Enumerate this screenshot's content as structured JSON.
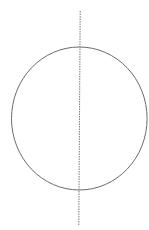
{
  "diagram": {
    "width": 149,
    "height": 230,
    "background": "#ffffff",
    "circle": {
      "cx": 79.3,
      "cy": 118.5,
      "rx": 67.8,
      "ry": 71.5,
      "stroke": "#6b6b6b",
      "stroke_width": 1
    },
    "axis_line": {
      "x1": 80.2,
      "y1": 11,
      "x2": 78.8,
      "y2": 226,
      "stroke": "#7a7a7a",
      "stroke_width": 1,
      "dasharray": "1.5 1"
    }
  }
}
